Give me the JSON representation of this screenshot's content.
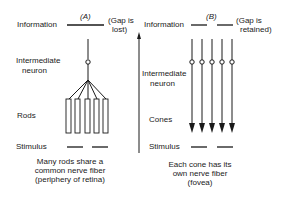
{
  "panel_a": {
    "label": "(A)",
    "information": "Information",
    "gap_note_line1": "(Gap is",
    "gap_note_line2": "lost)",
    "intermediate_line1": "Intermediate",
    "intermediate_line2": "neuron",
    "receptor": "Rods",
    "stimulus": "Stimulus",
    "caption_line1": "Many rods share a",
    "caption_line2": "common nerve fiber",
    "caption_line3": "(periphery of retina)"
  },
  "panel_b": {
    "label": "(B)",
    "information": "Information",
    "gap_note_line1": "(Gap is",
    "gap_note_line2": "retained)",
    "intermediate_line1": "Intermediate",
    "intermediate_line2": "neuron",
    "receptor": "Cones",
    "stimulus": "Stimulus",
    "caption_line1": "Each cone has its",
    "caption_line2": "own nerve fiber",
    "caption_line3": "(fovea)"
  },
  "colors": {
    "ink": "#1a1a1a",
    "background": "#ffffff"
  }
}
